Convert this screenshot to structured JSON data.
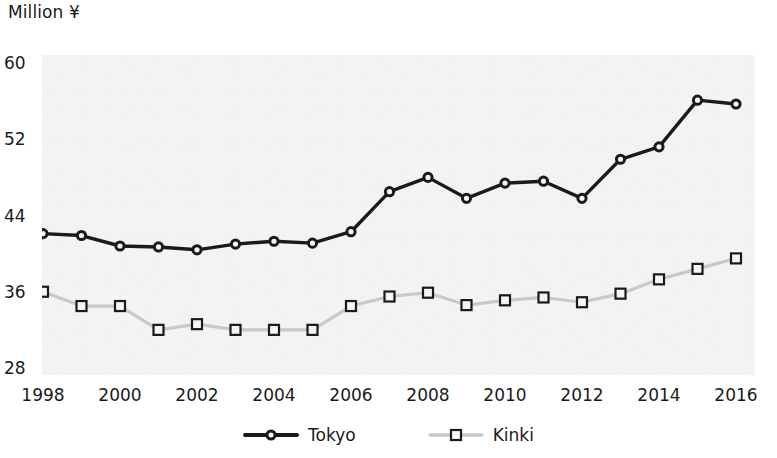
{
  "chart_data": {
    "type": "line",
    "title": "Million ¥",
    "xlabel": "",
    "ylabel": "Million ¥",
    "ylim": [
      28,
      60
    ],
    "ytick_step": 8,
    "yticks": [
      28,
      36,
      44,
      52,
      60
    ],
    "xlim": [
      1998,
      2016
    ],
    "xticks": [
      1998,
      2000,
      2002,
      2004,
      2006,
      2008,
      2010,
      2012,
      2014,
      2016
    ],
    "x": [
      1998,
      1999,
      2000,
      2001,
      2002,
      2003,
      2004,
      2005,
      2006,
      2007,
      2008,
      2009,
      2010,
      2011,
      2012,
      2013,
      2014,
      2015,
      2016
    ],
    "grid": false,
    "legend_position": "bottom",
    "series": [
      {
        "name": "Tokyo",
        "color": "#1a1a1a",
        "marker": "circle",
        "values": [
          42.1,
          41.9,
          40.8,
          40.7,
          40.4,
          41.0,
          41.3,
          41.1,
          42.3,
          46.5,
          48.0,
          45.8,
          47.4,
          47.6,
          45.8,
          49.9,
          51.2,
          56.1,
          55.7
        ]
      },
      {
        "name": "Kinki",
        "color": "#c9c9c9",
        "marker": "square",
        "values": [
          36.0,
          34.5,
          34.5,
          32.0,
          32.6,
          32.0,
          32.0,
          32.0,
          34.5,
          35.5,
          35.9,
          34.6,
          35.1,
          35.4,
          34.9,
          35.8,
          37.3,
          38.4,
          39.5
        ]
      }
    ]
  },
  "axis": {
    "title": "Million ¥",
    "ytick_labels": [
      "60",
      "52",
      "44",
      "36",
      "28"
    ],
    "xtick_labels": [
      "1998",
      "2000",
      "2002",
      "2004",
      "2006",
      "2008",
      "2010",
      "2012",
      "2014",
      "2016"
    ]
  },
  "legend": {
    "items": [
      {
        "label": "Tokyo",
        "marker": "circle-marker",
        "color": "#1a1a1a"
      },
      {
        "label": "Kinki",
        "marker": "square-marker",
        "color": "#c9c9c9"
      }
    ]
  }
}
